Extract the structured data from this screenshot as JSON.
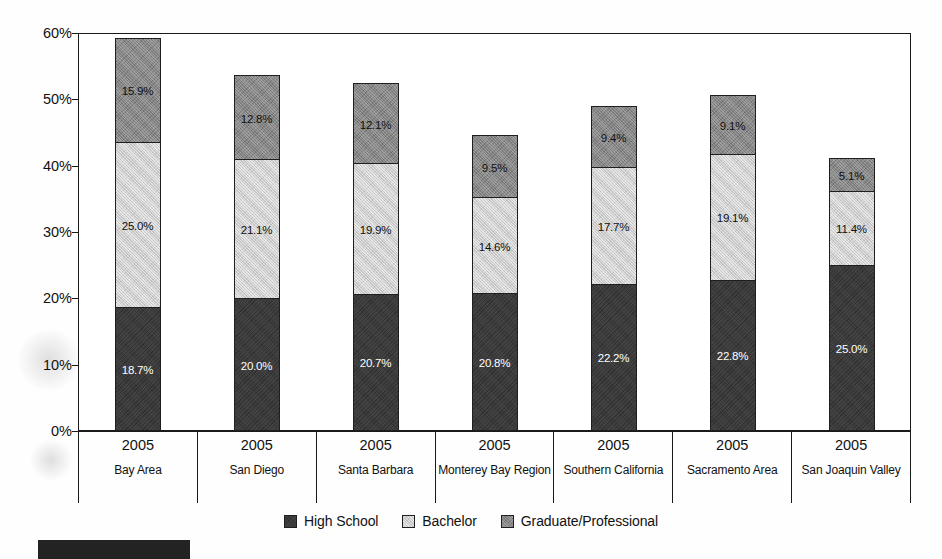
{
  "chart_data": {
    "type": "bar",
    "subtype": "stacked-bar",
    "title": "",
    "xlabel": "",
    "ylabel": "",
    "ylim": [
      0,
      60
    ],
    "ytick_labels": [
      "0%",
      "10%",
      "20%",
      "30%",
      "40%",
      "50%",
      "60%"
    ],
    "ytick_values": [
      0,
      10,
      20,
      30,
      40,
      50,
      60
    ],
    "grid": false,
    "legend_position": "bottom-center",
    "categories": [
      "Bay Area",
      "San Diego",
      "Santa Barbara",
      "Monterey Bay Region",
      "Southern California",
      "Sacramento Area",
      "San Joaquin Valley"
    ],
    "category_years": [
      "2005",
      "2005",
      "2005",
      "2005",
      "2005",
      "2005",
      "2005"
    ],
    "series": [
      {
        "name": "High School",
        "color": "#3a3a3a",
        "values": [
          18.7,
          20.0,
          20.7,
          20.8,
          22.2,
          22.8,
          25.0
        ],
        "labels": [
          "18.7%",
          "20.0%",
          "20.7%",
          "20.8%",
          "22.2%",
          "22.8%",
          "25.0%"
        ]
      },
      {
        "name": "Bachelor",
        "color": "#cbcbcb",
        "values": [
          25.0,
          21.1,
          19.9,
          14.6,
          17.7,
          19.1,
          11.4
        ],
        "labels": [
          "25.0%",
          "21.1%",
          "19.9%",
          "14.6%",
          "17.7%",
          "19.1%",
          "11.4%"
        ]
      },
      {
        "name": "Graduate/Professional",
        "color": "#848484",
        "values": [
          15.9,
          12.8,
          12.1,
          9.5,
          9.4,
          9.1,
          5.1
        ],
        "labels": [
          "15.9%",
          "12.8%",
          "12.1%",
          "9.5%",
          "9.4%",
          "9.1%",
          "5.1%"
        ]
      }
    ],
    "totals": [
      59.6,
      53.9,
      52.7,
      44.9,
      49.3,
      51.0,
      41.5
    ]
  },
  "axis": {
    "y_labels": [
      "60%",
      "50%",
      "40%",
      "30%",
      "20%",
      "10%",
      "0%"
    ]
  },
  "legend": {
    "items": [
      {
        "label": "High School",
        "swatch": "legend-swatch-high-school"
      },
      {
        "label": "Bachelor",
        "swatch": "legend-swatch-bachelor"
      },
      {
        "label": "Graduate/Professional",
        "swatch": "legend-swatch-graduate-professional"
      }
    ]
  },
  "categories_display": [
    {
      "year": "2005",
      "name": "Bay Area"
    },
    {
      "year": "2005",
      "name": "San Diego"
    },
    {
      "year": "2005",
      "name": "Santa Barbara"
    },
    {
      "year": "2005",
      "name": "Monterey Bay Region"
    },
    {
      "year": "2005",
      "name": "Southern California"
    },
    {
      "year": "2005",
      "name": "Sacramento Area"
    },
    {
      "year": "2005",
      "name": "San Joaquin Valley"
    }
  ],
  "colors": {
    "high_school": "#3a3a3a",
    "bachelor": "#cbcbcb",
    "graduate_professional": "#848484",
    "axis": "#1a1a1a",
    "background": "#ffffff"
  }
}
